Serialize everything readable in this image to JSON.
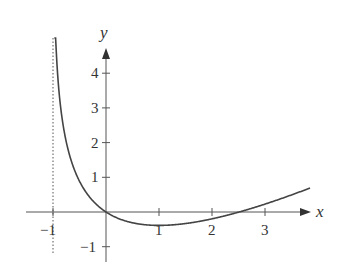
{
  "chart_data": {
    "type": "line",
    "title": "",
    "xlabel": "x",
    "ylabel": "y",
    "function": "y = x - 2 ln(1 + x)",
    "asymptote": {
      "x": -1,
      "style": "dotted"
    },
    "xlim": [
      -1.5,
      3.9
    ],
    "ylim": [
      -1.4,
      5.0
    ],
    "x_ticks": [
      -1,
      1,
      2,
      3
    ],
    "x_tick_labels": [
      "−1",
      "1",
      "2",
      "3"
    ],
    "y_ticks": [
      4,
      3,
      2,
      1,
      -1
    ],
    "y_tick_labels": [
      "4",
      "3",
      "2",
      "1",
      "−1"
    ],
    "grid": false,
    "series": [
      {
        "name": "curve",
        "x": [
          -0.9,
          -0.8,
          -0.7,
          -0.6,
          -0.5,
          -0.4,
          -0.3,
          -0.2,
          -0.1,
          0,
          0.5,
          1,
          1.5,
          2,
          2.5,
          3,
          3.5,
          3.85
        ],
        "y": [
          4.51,
          2.42,
          1.71,
          1.23,
          0.89,
          0.62,
          0.41,
          0.25,
          0.11,
          0,
          -0.31,
          -0.39,
          -0.33,
          -0.2,
          0.0,
          0.23,
          0.49,
          0.69
        ]
      }
    ],
    "annotations": {
      "minimum": {
        "x": 1,
        "y": -0.386
      },
      "x_intercepts": [
        0,
        2.51
      ]
    }
  }
}
